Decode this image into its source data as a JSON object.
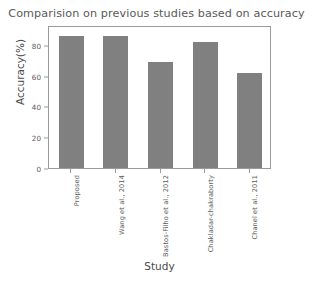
{
  "chart_data": {
    "type": "bar",
    "title": "Comparision on previous studies based on accuracy",
    "xlabel": "Study",
    "ylabel": "Accuracy(%)",
    "categories": [
      "Proposed",
      "Wang et al., 2014",
      "Bastos-Filho et al., 2012",
      "Chakladar-chakraborty",
      "Chanel et al., 2011"
    ],
    "values": [
      86,
      86,
      69,
      82,
      62
    ],
    "ylim": [
      0,
      93
    ],
    "yticks": [
      0,
      20,
      40,
      60,
      80
    ],
    "ytick_labels": [
      "0",
      "20",
      "40",
      "60",
      "80"
    ],
    "grid": false,
    "legend": "none",
    "bar_color": "#808080",
    "frame_color": "#9a9a9a",
    "background_color": "#ffffff"
  }
}
